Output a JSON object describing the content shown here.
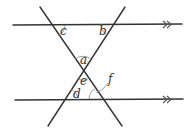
{
  "diagram": {
    "type": "parallel-lines-transversals",
    "labels": {
      "a": "a",
      "b": "b",
      "c": "c",
      "d": "d",
      "e": "e",
      "f": "f"
    },
    "parallel_marker": "double-arrow",
    "lines": [
      {
        "name": "top-parallel-line",
        "x1": 13,
        "y1": 25,
        "x2": 182,
        "y2": 24
      },
      {
        "name": "bottom-parallel-line",
        "x1": 15,
        "y1": 100,
        "x2": 183,
        "y2": 99
      },
      {
        "name": "transversal-left-to-right",
        "x1": 40,
        "y1": 7,
        "x2": 122,
        "y2": 126
      },
      {
        "name": "transversal-right-to-left",
        "x1": 125,
        "y1": 7,
        "x2": 48,
        "y2": 126
      }
    ],
    "colors": {
      "line": "#333333",
      "arc": "#888888",
      "background": "#ffffff"
    }
  }
}
